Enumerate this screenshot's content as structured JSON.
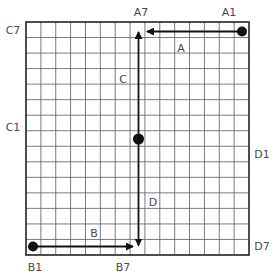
{
  "grid": {
    "x": 26,
    "y": 22,
    "width": 223,
    "height": 233,
    "cols": 15,
    "rows": 15,
    "line_color": "#5a5a5a",
    "border_color": "#222222"
  },
  "arrows": [
    {
      "id": "A",
      "label": "A",
      "from": [
        242,
        31.5
      ],
      "to": [
        147,
        31.5
      ],
      "start_dot": true,
      "double": false,
      "label_pos": [
        181,
        52
      ]
    },
    {
      "id": "B",
      "label": "B",
      "from": [
        33,
        246.5
      ],
      "to": [
        133,
        246.5
      ],
      "start_dot": true,
      "double": false,
      "label_pos": [
        94,
        237
      ]
    },
    {
      "id": "C",
      "label": "C",
      "from": [
        138.5,
        139
      ],
      "to": [
        138.5,
        32
      ],
      "start_dot": true,
      "double": false,
      "label_pos": [
        123,
        83
      ]
    },
    {
      "id": "D",
      "label": "D",
      "from": [
        138.5,
        139
      ],
      "to": [
        138.5,
        245.5
      ],
      "start_dot": false,
      "double": false,
      "label_pos": [
        153,
        206
      ]
    }
  ],
  "center_dot": [
    138.5,
    139
  ],
  "endpoint_labels": [
    {
      "text": "A7",
      "x": 141,
      "y": 16
    },
    {
      "text": "A1",
      "x": 229,
      "y": 16
    },
    {
      "text": "C7",
      "x": 13,
      "y": 34
    },
    {
      "text": "C1",
      "x": 13,
      "y": 131
    },
    {
      "text": "D1",
      "x": 262,
      "y": 158
    },
    {
      "text": "D7",
      "x": 262,
      "y": 250
    },
    {
      "text": "B1",
      "x": 35,
      "y": 271
    },
    {
      "text": "B7",
      "x": 123,
      "y": 271
    }
  ],
  "colors": {
    "arrow": "#111111",
    "dot": "#111111",
    "text": "#4a4a4a"
  }
}
